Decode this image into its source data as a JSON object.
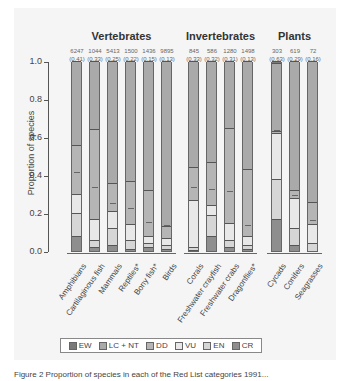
{
  "chart_data": {
    "type": "bar",
    "stacked": true,
    "ylabel": "Proportion of species",
    "ylim": [
      0,
      1.0
    ],
    "yticks": [
      "0.0",
      "0.2",
      "0.4",
      "0.6",
      "0.8",
      "1.0"
    ],
    "groups": [
      {
        "title": "Vertebrates",
        "categories": [
          "Amphibians",
          "Cartilaginous fish",
          "Mammals",
          "Reptiles*",
          "Bony fish*",
          "Birds"
        ]
      },
      {
        "title": "Invertebrates",
        "categories": [
          "Corals",
          "Freshwater crayfish",
          "Freshwater crabs",
          "Dragonflies*"
        ]
      },
      {
        "title": "Plants",
        "categories": [
          "Cycads",
          "Conifers",
          "Seagrasses"
        ]
      }
    ],
    "categories": [
      "Amphibians",
      "Cartilaginous fish",
      "Mammals",
      "Reptiles*",
      "Bony fish*",
      "Birds",
      "Corals",
      "Freshwater crayfish",
      "Freshwater crabs",
      "Dragonflies*",
      "Cycads",
      "Conifers",
      "Seagrasses"
    ],
    "species_counts": [
      "6247",
      "1044",
      "5413",
      "1500",
      "1436",
      "9895",
      "845",
      "586",
      "1280",
      "1498",
      "303",
      "619",
      "72"
    ],
    "threat_estimates": [
      "(0.41)",
      "(0.33)",
      "(0.25)",
      "(0.22)",
      "(0.15)",
      "(0.13)",
      "(0.33)",
      "(0.32)",
      "(0.31)",
      "(0.13)",
      "(0.63)",
      "(0.29)",
      "(0.16)"
    ],
    "threat_values": [
      0.41,
      0.33,
      0.25,
      0.22,
      0.15,
      0.13,
      0.33,
      0.32,
      0.31,
      0.13,
      0.63,
      0.29,
      0.16
    ],
    "series": [
      {
        "name": "CR",
        "values": [
          0.08,
          0.02,
          0.03,
          0.01,
          0.02,
          0.01,
          0.005,
          0.08,
          0.02,
          0.01,
          0.17,
          0.03,
          0.0
        ]
      },
      {
        "name": "EN",
        "values": [
          0.12,
          0.04,
          0.09,
          0.05,
          0.02,
          0.02,
          0.015,
          0.11,
          0.04,
          0.02,
          0.21,
          0.09,
          0.04
        ]
      },
      {
        "name": "VU",
        "values": [
          0.1,
          0.11,
          0.09,
          0.08,
          0.04,
          0.04,
          0.25,
          0.05,
          0.09,
          0.05,
          0.24,
          0.16,
          0.1
        ]
      },
      {
        "name": "DD",
        "values": [
          0.26,
          0.47,
          0.15,
          0.23,
          0.24,
          0.06,
          0.17,
          0.23,
          0.5,
          0.35,
          0.01,
          0.04,
          0.12
        ]
      },
      {
        "name": "LC + NT",
        "values": [
          0.44,
          0.36,
          0.64,
          0.63,
          0.68,
          0.87,
          0.56,
          0.53,
          0.35,
          0.57,
          0.36,
          0.68,
          0.74
        ]
      },
      {
        "name": "EW",
        "values": [
          0,
          0,
          0,
          0,
          0,
          0,
          0,
          0,
          0,
          0,
          0.01,
          0,
          0
        ]
      }
    ],
    "legend": [
      "EW",
      "LC + NT",
      "DD",
      "VU",
      "EN",
      "CR"
    ],
    "legend_position": "bottom",
    "colors": {
      "EW": "#7a7a7a",
      "LC + NT": "#aaaaaa",
      "DD": "#b5b5b5",
      "VU": "#e8e8e8",
      "EN": "#d6d6d6",
      "CR": "#8e8e8e"
    }
  },
  "caption": "Figure 2 Proportion of species in each of the Red List categories 1991..."
}
